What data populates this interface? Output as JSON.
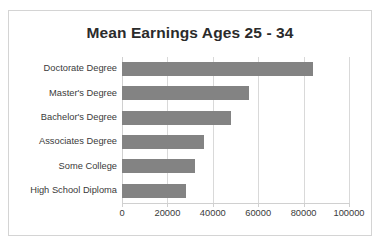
{
  "chart_data": {
    "type": "bar",
    "orientation": "horizontal",
    "title": "Mean Earnings Ages 25 - 34",
    "xlabel": "",
    "ylabel": "",
    "categories": [
      "Doctorate Degree",
      "Master's Degree",
      "Bachelor's Degree",
      "Associates Degree",
      "Some College",
      "High School Diploma"
    ],
    "values": [
      84000,
      56000,
      48000,
      36000,
      32000,
      28000
    ],
    "xlim": [
      0,
      100000
    ],
    "xticks": [
      0,
      20000,
      40000,
      60000,
      80000,
      100000
    ],
    "xtick_labels": [
      "0",
      "20000",
      "40000",
      "60000",
      "80000",
      "100000"
    ],
    "grid": true,
    "legend": false,
    "bar_color": "#838383",
    "gridline_color": "#d9d9d9",
    "frame_color": "#d4d4d4",
    "title_color": "#2b2b2b",
    "label_color": "#3a3a3a"
  }
}
